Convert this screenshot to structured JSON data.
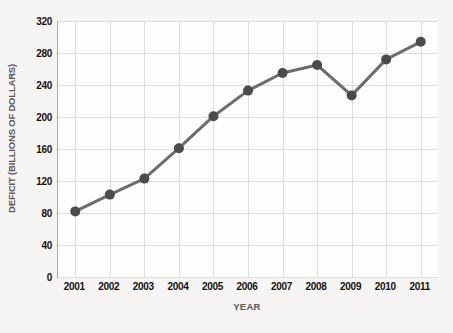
{
  "chart_data": {
    "type": "line",
    "title": "",
    "xlabel": "YEAR",
    "ylabel": "DEFICIT (BILLIONS OF DOLLARS)",
    "categories": [
      "2001",
      "2002",
      "2003",
      "2004",
      "2005",
      "2006",
      "2007",
      "2008",
      "2009",
      "2010",
      "2011"
    ],
    "values": [
      82,
      103,
      123,
      161,
      201,
      233,
      255,
      265,
      227,
      272,
      294
    ],
    "series": [
      {
        "name": "Deficit",
        "values": [
          82,
          103,
          123,
          161,
          201,
          233,
          255,
          265,
          227,
          272,
          294
        ]
      }
    ],
    "ylim": [
      0,
      320
    ],
    "yticks": [
      0,
      40,
      80,
      120,
      160,
      200,
      240,
      280,
      320
    ],
    "ytick_labels": [
      "0",
      "40",
      "80",
      "120",
      "160",
      "200",
      "240",
      "280",
      "320"
    ],
    "xtick_labels": [
      "2001",
      "2002",
      "2003",
      "2004",
      "2005",
      "2006",
      "2007",
      "2008",
      "2009",
      "2010",
      "2011"
    ],
    "grid": true,
    "legend": false,
    "legend_position": "none",
    "colors": {
      "line": "#6d6d6d",
      "marker": "#4b4b4b",
      "gridline": "#dddddd",
      "axis": "#a9a9a9",
      "tick_label": "#111111",
      "axis_title": "#58585a",
      "plot_background": "#fdfdfc",
      "page_background": "#f6f5f3"
    },
    "style": {
      "line_width": 3,
      "marker_radius": 5,
      "marker_shape": "circle"
    }
  }
}
